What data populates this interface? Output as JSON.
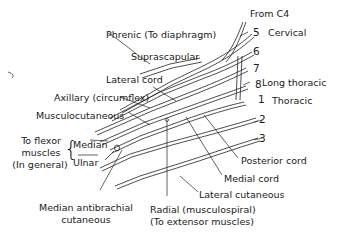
{
  "diagram": {
    "roots": {
      "from_c4": "From C4",
      "c5": "5",
      "cervical": "Cervical",
      "c6": "6",
      "c7": "7",
      "c8": "8",
      "t1": "1",
      "thoracic": "Thoracic",
      "t2": "2",
      "t3": "3"
    },
    "labels": {
      "phrenic": "Phrenic (To diaphragm)",
      "suprascapular": "Suprascapular",
      "lateral_cord": "Lateral cord",
      "axillary": "Axillary (circumflex)",
      "musculocutaneous": "Musculocutaneous",
      "long_thoracic": "Long thoracic",
      "median": "Median",
      "ulnar": "Ulnar",
      "to_flexor_line1": "To flexor",
      "to_flexor_line2": "muscles",
      "to_flexor_line3": "(In general)",
      "posterior_cord": "Posterior cord",
      "medial_cord": "Medial cord",
      "lateral_cutaneous": "Lateral cutaneous",
      "median_antibrachial_line1": "Median antibrachial",
      "median_antibrachial_line2": "cutaneous",
      "radial_line1": "Radial (musculospiral)",
      "radial_line2": "(To extensor muscles)"
    }
  }
}
